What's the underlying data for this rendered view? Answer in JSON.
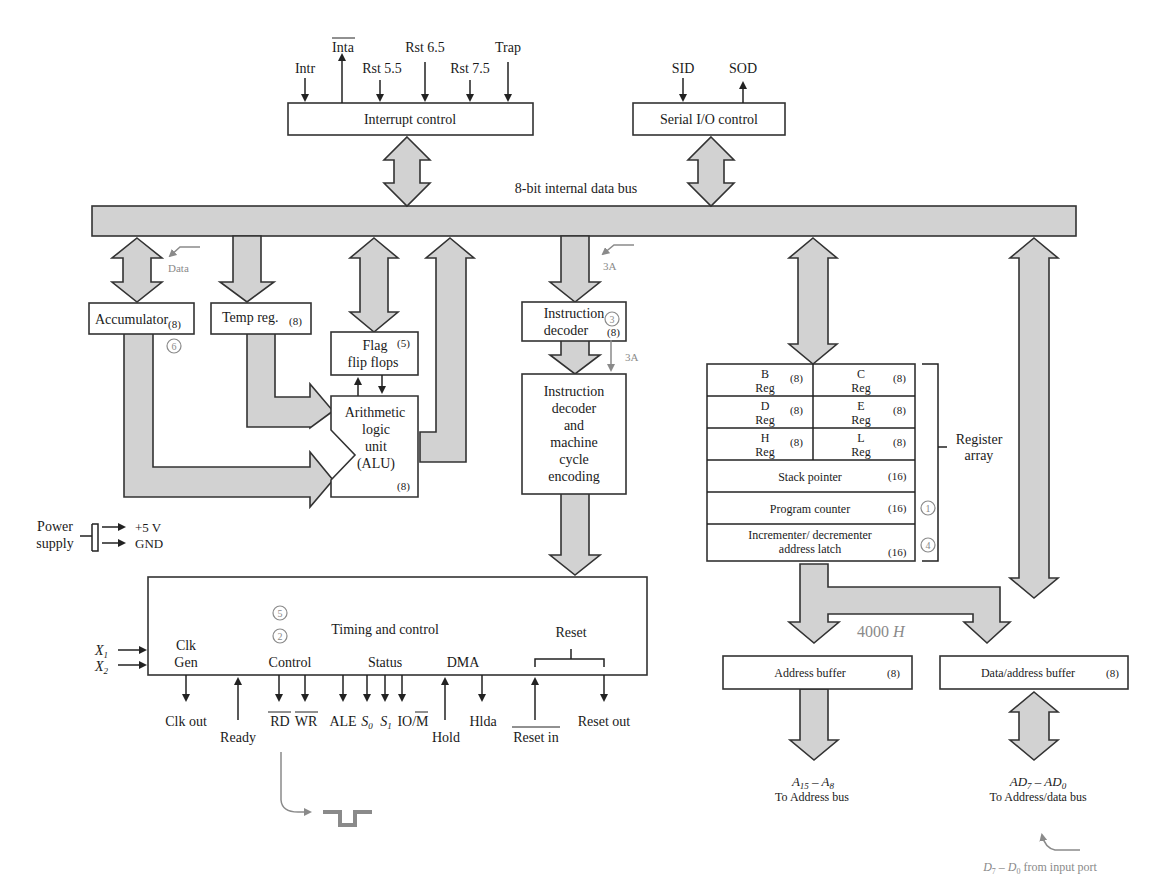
{
  "colors": {
    "bus_fill": "#d2d2d2",
    "outline": "#333333",
    "annotation": "#8a8a8a"
  },
  "interrupt": {
    "box_label": "Interrupt control",
    "signals": [
      {
        "label": "Intr",
        "direction": "in"
      },
      {
        "label": "Inta",
        "direction": "out",
        "overline": true
      },
      {
        "label": "Rst 5.5",
        "direction": "in"
      },
      {
        "label": "Rst 6.5",
        "direction": "in"
      },
      {
        "label": "Rst 7.5",
        "direction": "in"
      },
      {
        "label": "Trap",
        "direction": "in"
      }
    ]
  },
  "serial": {
    "box_label": "Serial I/O control",
    "signals": [
      {
        "label": "SID",
        "direction": "in"
      },
      {
        "label": "SOD",
        "direction": "out"
      }
    ]
  },
  "bus_label": "8-bit internal data bus",
  "blocks": {
    "accumulator": {
      "label": "Accumulator",
      "size": "(8)"
    },
    "temp_reg": {
      "label": "Temp reg.",
      "size": "(8)"
    },
    "flags": {
      "line1": "Flag",
      "line2": "flip flops",
      "size": "(5)"
    },
    "alu": {
      "lines": [
        "Arithmetic",
        "logic",
        "unit",
        "(ALU)"
      ],
      "size": "(8)"
    },
    "instr_reg": {
      "line1": "Instruction",
      "line2": "decoder",
      "size": "(8)"
    },
    "decoder": {
      "lines": [
        "Instruction",
        "decoder",
        "and",
        "machine",
        "cycle",
        "encoding"
      ]
    },
    "timing": {
      "label": "Timing and control"
    },
    "address_buffer": {
      "label": "Address buffer",
      "size": "(8)"
    },
    "data_address_buffer": {
      "label": "Data/address buffer",
      "size": "(8)"
    }
  },
  "register_array": {
    "label_line1": "Register",
    "label_line2": "array",
    "pairs": [
      {
        "left": "B",
        "right": "C",
        "sub": "Reg",
        "size": "(8)"
      },
      {
        "left": "D",
        "right": "E",
        "sub": "Reg",
        "size": "(8)"
      },
      {
        "left": "H",
        "right": "L",
        "sub": "Reg",
        "size": "(8)"
      }
    ],
    "stack_pointer": {
      "label": "Stack pointer",
      "size": "(16)"
    },
    "program_counter": {
      "label": "Program counter",
      "size": "(16)"
    },
    "inc_dec": {
      "line1": "Incrementer/ decrementer",
      "line2": "address latch",
      "size": "(16)"
    }
  },
  "power": {
    "label_line1": "Power",
    "label_line2": "supply",
    "vcc": "+5 V",
    "gnd": "GND"
  },
  "timing_groups": {
    "clk": {
      "line1": "Clk",
      "line2": "Gen"
    },
    "control": "Control",
    "status": "Status",
    "dma": "DMA",
    "reset": "Reset"
  },
  "clock_inputs": [
    "X1",
    "X2"
  ],
  "timing_signals": {
    "clk_out": "Clk out",
    "ready": "Ready",
    "rd": "RD",
    "wr": "WR",
    "ale": "ALE",
    "s0": "S0",
    "s1": "S1",
    "io_m": "IO/M",
    "hold": "Hold",
    "hlda": "Hlda",
    "reset_in": "Reset in",
    "reset_out": "Reset out"
  },
  "outputs": {
    "address_bus_line1": "A15 – A8",
    "address_bus_line2": "To Address bus",
    "data_bus_line1": "AD7 – AD0",
    "data_bus_line2": "To Address/data bus"
  },
  "annotations": {
    "data": "Data",
    "three_a_1": "3A",
    "three_a_2": "3A",
    "addr_value": "4000 H",
    "input_port": "D7 – D0 from input port",
    "circled": [
      "1",
      "2",
      "3",
      "4",
      "5",
      "6"
    ]
  }
}
